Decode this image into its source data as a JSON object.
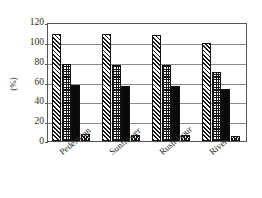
{
  "chart_data": {
    "type": "bar",
    "title": "",
    "xlabel": "",
    "ylabel": "(%)",
    "ylim": [
      0,
      120
    ],
    "ytick_step": 20,
    "yticks": [
      "0",
      "20",
      "40",
      "60",
      "80",
      "100",
      "120"
    ],
    "grid": true,
    "legend": "none",
    "categories": [
      "Pedestrian",
      "Sunflower",
      "Rush Hour",
      "River"
    ],
    "series": [
      {
        "name": "series-1",
        "pattern": "diagonal-hatch",
        "values": [
          108,
          108,
          107,
          99
        ]
      },
      {
        "name": "series-2",
        "pattern": "checkerboard",
        "values": [
          78,
          77,
          77,
          70
        ]
      },
      {
        "name": "series-3",
        "pattern": "solid-black",
        "values": [
          56,
          55,
          55,
          52
        ]
      },
      {
        "name": "series-4",
        "pattern": "cross-hatch",
        "values": [
          7,
          6,
          6.5,
          5
        ]
      }
    ],
    "colors": {
      "ink": "#141414",
      "frame": "#555555",
      "grid": "#8a8a8a",
      "background": "#ffffff"
    }
  }
}
